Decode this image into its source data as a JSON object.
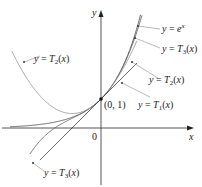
{
  "figure": {
    "axes": {
      "x_label": "x",
      "y_label": "y",
      "origin_label": "0"
    },
    "point_label": "(0, 1)",
    "curves": [
      {
        "id": "exp",
        "label_prefix": "y = ",
        "label_main": "e",
        "label_sup": "x",
        "color": "#555555"
      },
      {
        "id": "T3",
        "label_prefix": "y = ",
        "label_main": "T",
        "label_sub": "3",
        "label_suffix": "(x)",
        "color": "#555555"
      },
      {
        "id": "T2",
        "label_prefix": "y = ",
        "label_main": "T",
        "label_sub": "2",
        "label_suffix": "(x)",
        "color": "#888888"
      },
      {
        "id": "T1",
        "label_prefix": "y = ",
        "label_main": "T",
        "label_sub": "1",
        "label_suffix": "(x)",
        "color": "#222222"
      }
    ],
    "labels": {
      "exp": "y = e^x",
      "T3_right": "y = T3(x)",
      "T2_right": "y = T2(x)",
      "T1": "y = T1(x)",
      "T2_left": "y = T2(x)",
      "T3_bottom": "y = T3(x)"
    }
  }
}
